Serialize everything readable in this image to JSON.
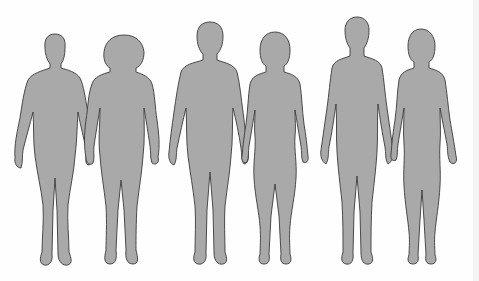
{
  "illustration": {
    "subject": "six human body silhouettes in three male-female pairs holding hands",
    "colors": {
      "fill": "#a9a9a9",
      "outline": "#3a3a3a",
      "background": "#fefefe"
    },
    "pairs": [
      {
        "label": "",
        "figures": [
          "male-stout",
          "female-stout"
        ]
      },
      {
        "label": "",
        "figures": [
          "male-average",
          "female-average"
        ]
      },
      {
        "label": "",
        "figures": [
          "male-slim",
          "female-slim"
        ]
      }
    ]
  }
}
